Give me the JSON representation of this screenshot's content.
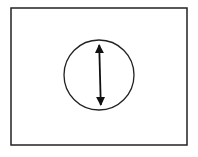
{
  "diagram": {
    "frame": {
      "x": 11,
      "y": 8,
      "width": 176,
      "height": 137,
      "stroke": "#222222"
    },
    "circle": {
      "cx": 99,
      "cy": 75,
      "r": 35,
      "stroke": "#222222"
    },
    "arrow": {
      "x1": 99,
      "y1": 43,
      "x2": 101,
      "y2": 107,
      "stroke": "#111111",
      "type": "double-headed"
    },
    "colors": {
      "background": "#ffffff",
      "line": "#222222"
    }
  }
}
